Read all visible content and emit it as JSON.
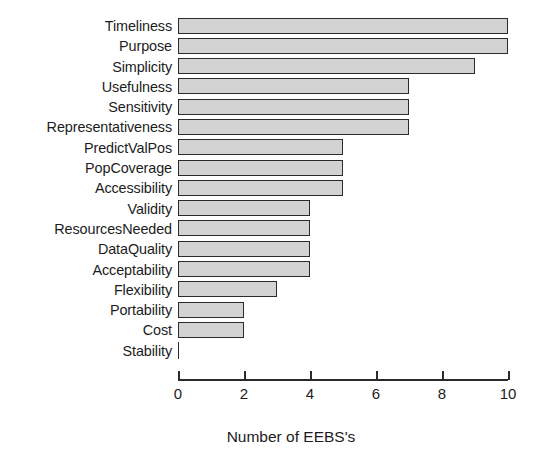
{
  "chart_data": {
    "type": "bar",
    "orientation": "horizontal",
    "title": "",
    "xlabel": "Number of EEBS's",
    "ylabel": "",
    "xlim": [
      0,
      10
    ],
    "xticks": [
      0,
      2,
      4,
      6,
      8,
      10
    ],
    "xticklabels": [
      "0",
      "2",
      "4",
      "6",
      "8",
      "10"
    ],
    "grid": false,
    "legend": false,
    "bar_fill_color": "#d2d2d2",
    "bar_edge_color": "#2b2b2b",
    "categories": [
      "Timeliness",
      "Purpose",
      "Simplicity",
      "Usefulness",
      "Sensitivity",
      "Representativeness",
      "PredictValPos",
      "PopCoverage",
      "Accessibility",
      "Validity",
      "ResourcesNeeded",
      "DataQuality",
      "Acceptability",
      "Flexibility",
      "Portability",
      "Cost",
      "Stability"
    ],
    "values": [
      10,
      10,
      9,
      7,
      7,
      7,
      5,
      5,
      5,
      4,
      4,
      4,
      4,
      3,
      2,
      2,
      0
    ]
  }
}
